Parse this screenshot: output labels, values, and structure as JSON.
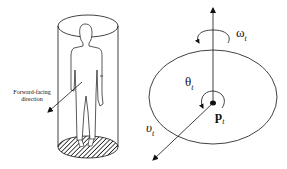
{
  "left_figure": {
    "caption_line1": "Forward-facing",
    "caption_line2": "direction",
    "elements": [
      "cylinder",
      "person-figure",
      "hatched-base",
      "forward-arrow"
    ]
  },
  "right_figure": {
    "omega": "ω",
    "omega_sub": "t",
    "theta": "θ",
    "theta_sub": "t",
    "p": "p",
    "p_sub": "t",
    "v": "υ",
    "v_sub": "t",
    "elements": [
      "ellipse",
      "vertical-axis-arrow",
      "rotation-arc",
      "angle-arc",
      "center-point",
      "velocity-arrow"
    ]
  },
  "colors": {
    "stroke": "#111111",
    "background": "#ffffff"
  }
}
